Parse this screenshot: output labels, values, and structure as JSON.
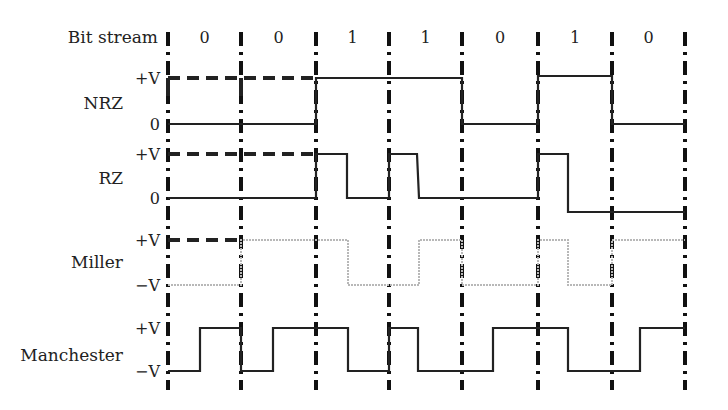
{
  "diagram": {
    "title_label": "Bit stream",
    "bits": [
      "0",
      "0",
      "1",
      "1",
      "0",
      "1",
      "0"
    ],
    "boundaries_x": [
      168,
      241,
      316,
      389,
      462,
      538,
      612,
      685
    ],
    "colors": {
      "stroke": "#222222",
      "miller": "#b8b8b8",
      "guide": "#111111"
    },
    "rows": [
      {
        "name": "NRZ",
        "label_y": 103,
        "levels": [
          {
            "label": "+V",
            "y": 78
          },
          {
            "label": "0",
            "y": 124
          }
        ],
        "ref_dashes": [
          {
            "x1": 168,
            "x2": 316,
            "y": 78
          }
        ],
        "ref_verticals": [
          {
            "x": 168,
            "y1": 78,
            "y2": 124
          },
          {
            "x": 241,
            "y1": 78,
            "y2": 124
          }
        ],
        "path": [
          [
            168,
            124
          ],
          [
            316,
            124
          ],
          [
            316,
            78
          ],
          [
            462,
            78
          ],
          [
            462,
            124
          ],
          [
            538,
            124
          ],
          [
            538,
            76
          ],
          [
            612,
            76
          ],
          [
            612,
            124
          ],
          [
            685,
            124
          ]
        ],
        "style": "solid"
      },
      {
        "name": "RZ",
        "label_y": 178,
        "levels": [
          {
            "label": "+V",
            "y": 154
          },
          {
            "label": "0",
            "y": 198
          }
        ],
        "ref_dashes": [
          {
            "x1": 168,
            "x2": 316,
            "y": 154
          }
        ],
        "ref_verticals": [],
        "path": [
          [
            168,
            198
          ],
          [
            316,
            198
          ],
          [
            316,
            154
          ],
          [
            347,
            154
          ],
          [
            347,
            198
          ],
          [
            389,
            198
          ],
          [
            389,
            154
          ],
          [
            417,
            154
          ],
          [
            419,
            198
          ],
          [
            538,
            198
          ],
          [
            538,
            154
          ],
          [
            568,
            154
          ],
          [
            568,
            212
          ],
          [
            685,
            212
          ]
        ],
        "style": "solid"
      },
      {
        "name": "Miller",
        "label_y": 262,
        "levels": [
          {
            "label": "+V",
            "y": 240
          },
          {
            "label": "−V",
            "y": 285
          }
        ],
        "ref_dashes": [
          {
            "x1": 168,
            "x2": 241,
            "y": 240
          }
        ],
        "ref_verticals": [],
        "path": [
          [
            168,
            285
          ],
          [
            241,
            285
          ],
          [
            241,
            240
          ],
          [
            348,
            240
          ],
          [
            348,
            285
          ],
          [
            419,
            285
          ],
          [
            419,
            240
          ],
          [
            462,
            240
          ],
          [
            462,
            285
          ],
          [
            538,
            285
          ],
          [
            538,
            240
          ],
          [
            568,
            240
          ],
          [
            568,
            285
          ],
          [
            612,
            285
          ],
          [
            612,
            240
          ],
          [
            685,
            240
          ]
        ],
        "style": "miller"
      },
      {
        "name": "Manchester",
        "label_y": 355,
        "levels": [
          {
            "label": "+V",
            "y": 328
          },
          {
            "label": "−V",
            "y": 371
          }
        ],
        "ref_dashes": [],
        "ref_verticals": [],
        "path": [
          [
            168,
            371
          ],
          [
            200,
            371
          ],
          [
            200,
            328
          ],
          [
            241,
            328
          ],
          [
            241,
            371
          ],
          [
            273,
            371
          ],
          [
            273,
            328
          ],
          [
            348,
            328
          ],
          [
            348,
            371
          ],
          [
            389,
            371
          ],
          [
            389,
            328
          ],
          [
            418,
            328
          ],
          [
            418,
            371
          ],
          [
            493,
            371
          ],
          [
            493,
            328
          ],
          [
            568,
            328
          ],
          [
            568,
            371
          ],
          [
            640,
            371
          ],
          [
            640,
            328
          ],
          [
            685,
            328
          ]
        ],
        "style": "solid"
      }
    ]
  }
}
